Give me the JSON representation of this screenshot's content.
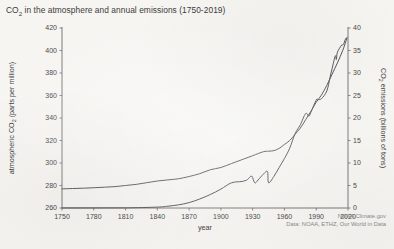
{
  "chart_data": {
    "type": "line",
    "title": "CO2 in the atmosphere and annual emissions (1750-2019)",
    "title_parts": {
      "pre": "CO",
      "sub": "2",
      "post": " in the atmosphere and annual emissions (1750-2019)"
    },
    "xlabel": "year",
    "ylabel_left_parts": {
      "pre": "atmospheric CO",
      "sub": "2",
      "post": " (parts per million)"
    },
    "ylabel_right_parts": {
      "pre": "CO",
      "sub": "2",
      "post": " emissions (billions of tons)"
    },
    "ylabel_left": "atmospheric CO2 (parts per million)",
    "ylabel_right": "CO2 emissions (billions of tons)",
    "xlim": [
      1750,
      2020
    ],
    "xticks": [
      1750,
      1780,
      1810,
      1840,
      1870,
      1900,
      1930,
      1960,
      1990,
      2020
    ],
    "ylim_left": [
      260,
      420
    ],
    "yticks_left": [
      260,
      280,
      300,
      320,
      340,
      360,
      380,
      400,
      420
    ],
    "ylim_right": [
      0,
      40
    ],
    "yticks_right": [
      0,
      5,
      10,
      15,
      20,
      25,
      30,
      35,
      40
    ],
    "grid": false,
    "legend": "none",
    "line_color": "#56565a",
    "series": [
      {
        "name": "atmospheric CO2 concentration",
        "axis": "left",
        "units": "parts per million",
        "x": [
          1750,
          1760,
          1770,
          1780,
          1790,
          1800,
          1810,
          1820,
          1830,
          1840,
          1850,
          1860,
          1870,
          1880,
          1890,
          1900,
          1910,
          1920,
          1930,
          1940,
          1945,
          1950,
          1955,
          1960,
          1965,
          1970,
          1975,
          1980,
          1985,
          1990,
          1995,
          2000,
          2005,
          2010,
          2015,
          2019
        ],
        "values": [
          277,
          277.3,
          277.6,
          278,
          278.5,
          279,
          280,
          281,
          282.5,
          284,
          285,
          286,
          288,
          290.5,
          294,
          296,
          299.5,
          303,
          306.5,
          310,
          310.5,
          311,
          313,
          316.5,
          320,
          325.5,
          331,
          338.5,
          346,
          354,
          360.5,
          369,
          379,
          389,
          400,
          411
        ]
      },
      {
        "name": "annual CO2 emissions",
        "axis": "right",
        "units": "billions of tons",
        "x": [
          1750,
          1780,
          1810,
          1840,
          1850,
          1860,
          1870,
          1880,
          1890,
          1900,
          1910,
          1920,
          1925,
          1929,
          1932,
          1935,
          1940,
          1944,
          1945,
          1950,
          1955,
          1960,
          1965,
          1970,
          1975,
          1980,
          1983,
          1985,
          1990,
          1992,
          1995,
          2000,
          2003,
          2005,
          2008,
          2009,
          2010,
          2014,
          2015,
          2016,
          2017,
          2018,
          2019
        ],
        "values": [
          0.01,
          0.02,
          0.03,
          0.2,
          0.4,
          0.7,
          1.2,
          2.0,
          3.0,
          4.2,
          5.6,
          5.9,
          6.3,
          7.1,
          5.6,
          6.2,
          7.5,
          8.1,
          5.6,
          7.0,
          9.0,
          11.0,
          13.3,
          16.5,
          18.5,
          21.0,
          20.4,
          21.3,
          24.0,
          24.1,
          24.3,
          26.0,
          29.0,
          31.0,
          33.8,
          33.0,
          34.6,
          36.2,
          36.2,
          36.5,
          37.2,
          37.7,
          37.9
        ]
      }
    ],
    "annotations": {
      "credit_line_1": "NOAA Climate.gov",
      "credit_line_2": "Data: NOAA, ETHZ, Our World in Data"
    }
  },
  "credits": {
    "line1": "NOAA Climate.gov",
    "line2": "Data: NOAA, ETHZ, Our World in Data"
  }
}
